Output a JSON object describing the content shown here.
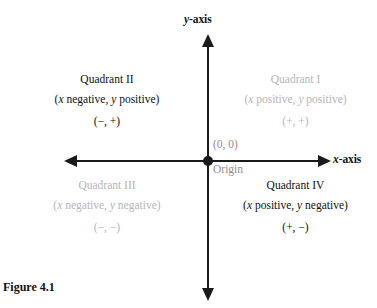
{
  "figure": {
    "caption": "Figure 4.1"
  },
  "axes": {
    "y_label_prefix": "y",
    "y_label_suffix": "-axis",
    "x_label_prefix": "x",
    "x_label_suffix": "-axis"
  },
  "origin": {
    "coordinates": "(0, 0)",
    "name": "Origin"
  },
  "quadrants": [
    {
      "title": "Quadrant I",
      "desc_x_var": "x",
      "desc_x_sign": " positive, ",
      "desc_y_var": "y",
      "desc_y_sign": " positive)",
      "desc_open": "(",
      "signs": "(+, +)",
      "tone": "light"
    },
    {
      "title": "Quadrant II",
      "desc_x_var": "x",
      "desc_x_sign": " negative, ",
      "desc_y_var": "y",
      "desc_y_sign": " positive)",
      "desc_open": "(",
      "signs": "(−, +)",
      "tone": "dark"
    },
    {
      "title": "Quadrant III",
      "desc_x_var": "x",
      "desc_x_sign": " negative, ",
      "desc_y_var": "y",
      "desc_y_sign": " negative)",
      "desc_open": "(",
      "signs": "(−, −)",
      "tone": "light"
    },
    {
      "title": "Quadrant IV",
      "desc_x_var": "x",
      "desc_x_sign": " positive, ",
      "desc_y_var": "y",
      "desc_y_sign": " negative)",
      "desc_open": "(",
      "signs": "(+, −)",
      "tone": "dark"
    }
  ],
  "colors": {
    "ink": "#111111",
    "grey": "#b6b6b6",
    "origin_grey": "#8f8f8f",
    "background": "#ffffff"
  }
}
